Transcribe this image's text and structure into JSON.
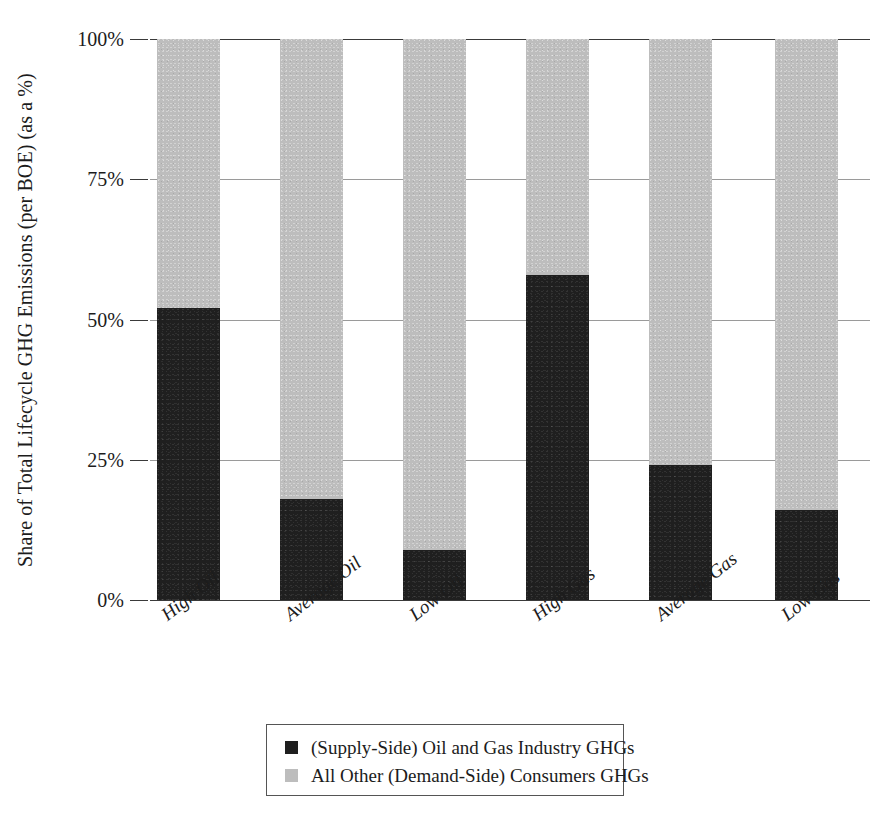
{
  "chart_data": {
    "type": "bar",
    "subtype": "stacked-100-percent",
    "title": "",
    "xlabel": "",
    "ylabel": "Share of Total Lifecycle GHG Emissions (per BOE) (as a %)",
    "categories": [
      "High Oil",
      "Average Oil",
      "Low Oil",
      "High Gas",
      "Average Gas",
      "Low Gas"
    ],
    "series": [
      {
        "name": "(Supply-Side) Oil and Gas Industry GHGs",
        "color": "#1f1f1f",
        "values": [
          52,
          18,
          9,
          58,
          24,
          16
        ]
      },
      {
        "name": "All Other (Demand-Side) Consumers GHGs",
        "color": "#bdbdbd",
        "values": [
          48,
          82,
          91,
          42,
          76,
          84
        ]
      }
    ],
    "ylim": [
      0,
      100
    ],
    "yticks": [
      0,
      25,
      50,
      75,
      100
    ],
    "ytick_labels": [
      "0%",
      "25%",
      "50%",
      "75%",
      "100%"
    ],
    "grid": true,
    "grid_axis": "y",
    "legend_position": "bottom",
    "stacked": true
  },
  "axis": {
    "y_title": "Share of Total Lifecycle GHG Emissions (per BOE) (as a %)",
    "ticks": [
      {
        "label": "100%",
        "value": 100
      },
      {
        "label": "75%",
        "value": 75
      },
      {
        "label": "50%",
        "value": 50
      },
      {
        "label": "25%",
        "value": 25
      },
      {
        "label": "0%",
        "value": 0
      }
    ]
  },
  "categories": [
    {
      "label": "High Oil"
    },
    {
      "label": "Average Oil"
    },
    {
      "label": "Low Oil"
    },
    {
      "label": "High Gas"
    },
    {
      "label": "Average Gas"
    },
    {
      "label": "Low Gas"
    }
  ],
  "legend": {
    "items": [
      {
        "label": "(Supply-Side) Oil and Gas Industry GHGs",
        "color": "#1f1f1f",
        "swatch": "supply"
      },
      {
        "label": "All Other (Demand-Side) Consumers GHGs",
        "color": "#bdbdbd",
        "swatch": "demand"
      }
    ]
  }
}
